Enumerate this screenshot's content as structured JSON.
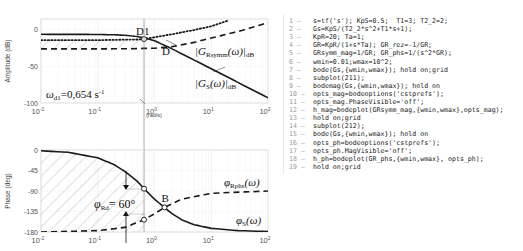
{
  "chart_data": [
    {
      "type": "line",
      "subplot": "magnitude",
      "ylabel": "Amplitude (dB)",
      "xlabel": "(rad/s)",
      "xscale": "log",
      "xlim": [
        0.01,
        100
      ],
      "ylim": [
        -100,
        15
      ],
      "yticks": [
        0,
        -50,
        -100
      ],
      "ytick_labels": [
        "0",
        "-50",
        "-100"
      ],
      "xticks": [
        0.01,
        0.1,
        1,
        10,
        100
      ],
      "xtick_labels": [
        "10",
        "10",
        "10",
        "10",
        "10"
      ],
      "xtick_exponents": [
        "-2",
        "-1",
        "0",
        "1",
        "2"
      ],
      "grid": true,
      "series": [
        {
          "name": "|Gs(ω)|dB",
          "style": "solid",
          "x": [
            0.01,
            0.05,
            0.1,
            0.2,
            0.3,
            0.5,
            0.7,
            1,
            2,
            5,
            10,
            30,
            100
          ],
          "y": [
            -6,
            -6.1,
            -6.2,
            -6.6,
            -7.3,
            -9,
            -11.2,
            -14.8,
            -25.5,
            -41.3,
            -53,
            -72.1,
            -93
          ]
        },
        {
          "name": "|GRsymm(ω)|dB",
          "style": "dashed",
          "x": [
            0.01,
            0.1,
            0.5,
            1,
            2,
            5,
            10,
            30,
            100
          ],
          "y": [
            -26,
            -26,
            -25.5,
            -25,
            -23,
            -17,
            -11,
            -2,
            10
          ]
        },
        {
          "name": "dotted",
          "style": "dotted",
          "x": [
            0.01,
            0.1,
            0.5,
            0.654,
            1,
            2,
            5,
            10,
            20
          ],
          "y": [
            -14,
            -14,
            -13,
            -12.5,
            -10,
            -6,
            0,
            5,
            13
          ]
        }
      ],
      "annotations": {
        "D1": "D1",
        "D": "D",
        "GRsymm_label": "|G",
        "GRsymm_sub": "Rsymm",
        "GRsymm_arg": "(ω)|",
        "GRsymm_dB": "dB",
        "Gs_label": "|G",
        "Gs_sub": "S",
        "Gs_arg": "(ω)|",
        "Gs_dB": "dB",
        "omega_d1": "ω",
        "omega_d1_sub": "d1",
        "omega_d1_value": "=0,654 s",
        "omega_d1_exp": "-1",
        "omega_d1_x": 0.654
      }
    },
    {
      "type": "line",
      "subplot": "phase",
      "ylabel": "Phase (deg)",
      "xscale": "log",
      "xlim": [
        0.01,
        100
      ],
      "ylim": [
        -180,
        0
      ],
      "yticks": [
        0,
        -45,
        -90,
        -135,
        -180
      ],
      "ytick_labels": [
        "0",
        "-45",
        "-90",
        "-135",
        "-180"
      ],
      "xticks": [
        0.01,
        0.1,
        1,
        10,
        100
      ],
      "xtick_labels": [
        "10",
        "10",
        "10",
        "10",
        "10"
      ],
      "xtick_exponents": [
        "-2",
        "-1",
        "0",
        "1",
        "2"
      ],
      "grid": true,
      "series": [
        {
          "name": "φS(ω)",
          "style": "solid",
          "x": [
            0.01,
            0.03,
            0.1,
            0.2,
            0.3,
            0.5,
            0.654,
            1,
            1.5,
            2,
            3,
            5,
            10,
            30,
            100
          ],
          "y": [
            -1.7,
            -5,
            -17,
            -33,
            -47,
            -69,
            -85,
            -108,
            -126,
            -139,
            -153,
            -164,
            -172,
            -177,
            -179
          ]
        },
        {
          "name": "φRphs(ω)",
          "style": "dashed",
          "x": [
            0.01,
            0.1,
            0.3,
            0.654,
            1,
            1.5,
            3,
            10,
            100
          ],
          "y": [
            -180,
            -177,
            -170,
            -153,
            -140,
            -126,
            -108,
            -95,
            -90
          ]
        }
      ],
      "annotations": {
        "B": "B",
        "phi_rd": "φ",
        "phi_rd_sub": "Rd",
        "phi_rd_value": "= 60°",
        "phi_rphs": "φ",
        "phi_rphs_sub": "Rphs",
        "phi_rphs_arg": "(ω)",
        "phi_s": "φ",
        "phi_s_sub": "S",
        "phi_s_arg": "(ω)"
      }
    }
  ],
  "code": {
    "lines": [
      {
        "n": "1 –",
        "text": "s=tf('s'); KpS=0.5;  T1=3; T2_2=2;"
      },
      {
        "n": "2 –",
        "text": "Gs=KpS/(T2_2*s^2+T1*s+1);"
      },
      {
        "n": "3 –",
        "text": "KpR=20; Ta=1;"
      },
      {
        "n": "4 –",
        "text": "GR=KpR/(1+s*Ta); GR_rez=-1/GR;"
      },
      {
        "n": "5 –",
        "text": "GRsymm_mag=1/GR; GR_phs=1/(s^2*GR);"
      },
      {
        "n": "6 –",
        "text": "wmin=0.01;wmax=10^2;"
      },
      {
        "n": "7 –",
        "text": "bode(Gs,{wmin,wmax}); hold on;grid"
      },
      {
        "n": "8 –",
        "text": "subplot(211);"
      },
      {
        "n": "9 –",
        "text": "bodemag(Gs,{wmin,wmax}); hold on"
      },
      {
        "n": "10 –",
        "text": "opts_mag=bodeoptions('cstprefs');"
      },
      {
        "n": "11 –",
        "text": "opts_mag.PhaseVisible='off';"
      },
      {
        "n": "12 –",
        "text": "h_mag=bodeplot(GRsymm_mag,{wmin,wmax},opts_mag);"
      },
      {
        "n": "13 –",
        "text": "hold on;grid"
      },
      {
        "n": "14 –",
        "text": "subplot(212);"
      },
      {
        "n": "15 –",
        "text": "bode(Gs,{wmin,wmax}); hold on"
      },
      {
        "n": "16 –",
        "text": "opts_ph=bodeoptions('cstprefs');"
      },
      {
        "n": "17 –",
        "text": "opts_ph.MagVisible='off';"
      },
      {
        "n": "18 –",
        "text": "h_ph=bodeplot(GR_phs,{wmin,wmax}, opts_ph);"
      },
      {
        "n": "19 –",
        "text": "hold on;grid"
      }
    ]
  }
}
